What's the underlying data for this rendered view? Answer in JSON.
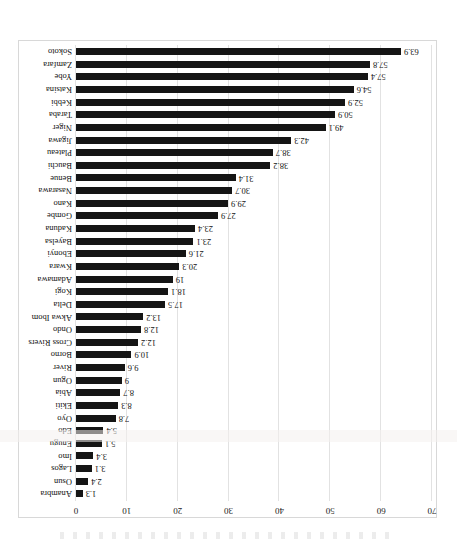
{
  "chart_data": {
    "type": "bar",
    "orientation": "horizontal",
    "title": "",
    "subtitle": "",
    "xlabel": "",
    "ylabel": "",
    "xlim": [
      0,
      70
    ],
    "xticks": [
      "0",
      "10",
      "20",
      "30",
      "40",
      "50",
      "60",
      "70"
    ],
    "xtick_values": [
      0,
      10,
      20,
      30,
      40,
      50,
      60,
      70
    ],
    "grid": true,
    "legend": "none",
    "bar_color": "#151515",
    "categories": [
      "Anambra",
      "Osun",
      "Lagos",
      "Imo",
      "Enugu",
      "Edo",
      "Oyo",
      "Ekiti",
      "Abia",
      "Ogun",
      "River",
      "Borno",
      "Cross Rivers",
      "Ondo",
      "Akwa Ibom",
      "Delta",
      "Kogi",
      "Adamawa",
      "Kwara",
      "Ebonyi",
      "Bayelsa",
      "Kaduna",
      "Gombe",
      "Kano",
      "Nasarawa",
      "Benue",
      "Bauchi",
      "Plateau",
      "Jigawa",
      "Niger",
      "Taraba",
      "Kebbi",
      "Katsina",
      "Yobe",
      "Zamfara",
      "Sokoto"
    ],
    "values": [
      1.3,
      2.4,
      3.1,
      3.4,
      5.1,
      5.4,
      7.8,
      8.3,
      8.7,
      9,
      9.6,
      10.9,
      12.2,
      12.8,
      13.2,
      17.5,
      18.1,
      19,
      20.3,
      21.6,
      23.1,
      23.4,
      27.9,
      29.9,
      30.7,
      31.4,
      38.2,
      38.7,
      42.3,
      49.1,
      50.9,
      52.9,
      54.6,
      57.4,
      57.8,
      63.9
    ],
    "value_labels": [
      "1.3",
      "2.4",
      "3.1",
      "3.4",
      "5.1",
      "5.4",
      "7.8",
      "8.3",
      "8.7",
      "9",
      "9.6",
      "10.9",
      "12.2",
      "12.8",
      "13.2",
      "17.5",
      "18.1",
      "19",
      "20.3",
      "21.6",
      "23.1",
      "23.4",
      "27.9",
      "29.9",
      "30.7",
      "31.4",
      "38.2",
      "38.7",
      "42.3",
      "49.1",
      "50.9",
      "52.9",
      "54.6",
      "57.4",
      "57.8",
      "63.9"
    ]
  }
}
